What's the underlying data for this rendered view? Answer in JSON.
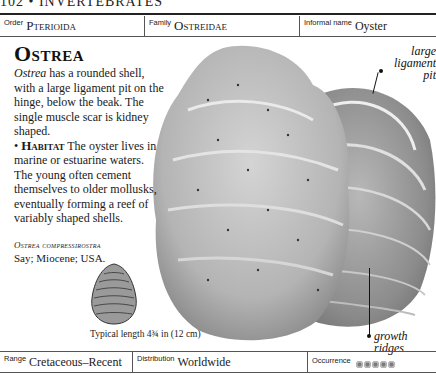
{
  "running_head": "102 • INVERTEBRATES",
  "top_bar": {
    "order_label": "Order",
    "order_value": "Pterioida",
    "family_label": "Family",
    "family_value": "Ostreidae",
    "informal_label": "Informal name",
    "informal_value": "Oyster"
  },
  "entry": {
    "title": "Ostrea",
    "genus_italic": "Ostrea",
    "description": " has a rounded shell, with a large ligament pit on the hinge, below the beak. The single muscle scar is kidney shaped.",
    "habitat_bullet": "•",
    "habitat_label": "Habitat",
    "habitat_text": " The oyster lives in marine or estuarine waters. The young often cement themselves to older mollusks, eventually forming a reef of variably shaped shells."
  },
  "species": {
    "name": "Ostrea compressirostra",
    "details": "Say; Miocene; USA."
  },
  "caption": "Typical length 4¾ in (12 cm)",
  "annotations": {
    "ligament": "large ligament pit",
    "ridges": "growth ridges"
  },
  "bottom_bar": {
    "range_label": "Range",
    "range_value": "Cretaceous–Recent",
    "distribution_label": "Distribution",
    "distribution_value": "Worldwide",
    "occurrence_label": "Occurrence",
    "occurrence_count": 5
  }
}
